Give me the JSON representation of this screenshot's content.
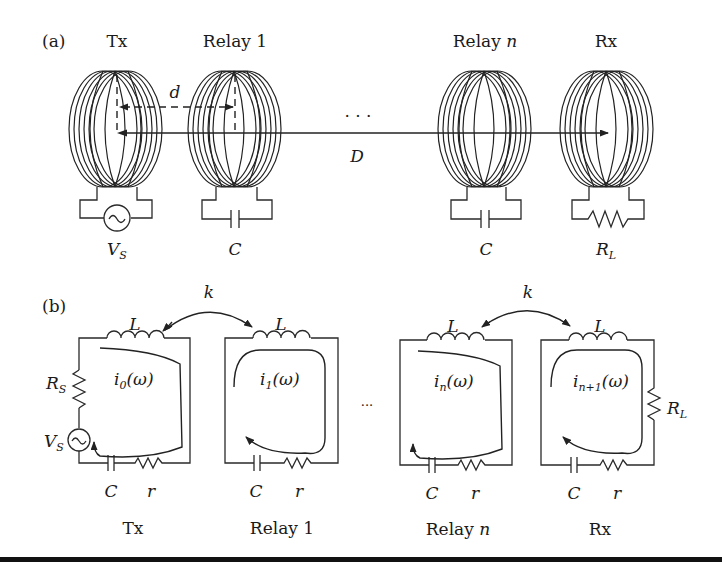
{
  "panel_a": {
    "label": "(a)",
    "nodes": [
      {
        "name": "Tx",
        "component": "V",
        "component_sub": "S"
      },
      {
        "name": "Relay 1",
        "component": "C",
        "component_sub": ""
      },
      {
        "name": "Relay ",
        "name_italic": "n",
        "component": "C",
        "component_sub": ""
      },
      {
        "name": "Rx",
        "component": "R",
        "component_sub": "L"
      }
    ],
    "d_label": "d",
    "D_label": "D",
    "ellipsis": "· · ·"
  },
  "panel_b": {
    "label": "(b)",
    "coupling_label": "k",
    "inductor_label": "L",
    "capacitor_label": "C",
    "resistor_label": "r",
    "source_resistor": {
      "main": "R",
      "sub": "S"
    },
    "source": {
      "main": "V",
      "sub": "S"
    },
    "load": {
      "main": "R",
      "sub": "L"
    },
    "ellipsis": "···",
    "loops": [
      {
        "name": "Tx",
        "current_main": "i",
        "current_sub": "0",
        "current_arg": "(ω)"
      },
      {
        "name": "Relay 1",
        "current_main": "i",
        "current_sub": "1",
        "current_arg": "(ω)"
      },
      {
        "name": "Relay ",
        "name_italic": "n",
        "current_main": "i",
        "current_sub": "n",
        "current_arg": "(ω)"
      },
      {
        "name": "Rx",
        "current_main": "i",
        "current_sub": "n+1",
        "current_arg": "(ω)"
      }
    ]
  }
}
